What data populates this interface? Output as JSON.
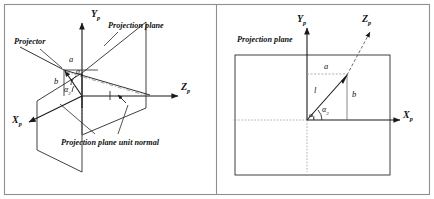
{
  "figure": {
    "background": "#ffffff",
    "stroke": "#1a1a1a",
    "frame_stroke": "#8a8a8a",
    "width": 434,
    "height": 199,
    "panels": [
      {
        "id": "left-panel",
        "name": "perspective-view",
        "labels": {
          "projection_plane": "Projection plane",
          "projector": "Projector",
          "unit_normal": "Projection plane unit normal",
          "axis_x": "X",
          "axis_y": "Y",
          "axis_z": "Z",
          "axis_sub": "p",
          "seg_a": "a",
          "seg_b": "b",
          "seg_l": "l",
          "angle_1": "α",
          "angle_1_sub": "1",
          "angle_2": "α",
          "angle_2_sub": "2"
        }
      },
      {
        "id": "right-panel",
        "name": "front-view",
        "labels": {
          "projection_plane": "Projection plane",
          "axis_x": "X",
          "axis_y": "Y",
          "axis_z": "Z",
          "axis_sub": "p",
          "seg_a": "a",
          "seg_b": "b",
          "seg_l": "l",
          "angle_1": "α",
          "angle_1_sub": "1",
          "angle_2": "α",
          "angle_2_sub": "2"
        }
      }
    ]
  }
}
